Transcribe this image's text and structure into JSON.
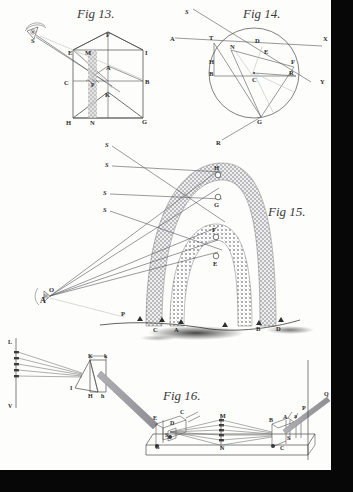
{
  "plate": {
    "description": "Engraved optics plate with four geometric figures",
    "paper_color": "#fdfdfb",
    "ink_color": "#3a3a3a",
    "border_color": "#070707"
  },
  "figures": [
    {
      "id": "fig13",
      "caption": "Fig 13.",
      "type": "house-section-geometry",
      "labels": [
        {
          "text": "S",
          "x": 34,
          "y": 40
        },
        {
          "text": "F",
          "x": 108,
          "y": 37
        },
        {
          "text": "E",
          "x": 70,
          "y": 55
        },
        {
          "text": "M",
          "x": 87,
          "y": 55
        },
        {
          "text": "I",
          "x": 146,
          "y": 55
        },
        {
          "text": "A",
          "x": 108,
          "y": 69
        },
        {
          "text": "C",
          "x": 66,
          "y": 86
        },
        {
          "text": "B",
          "x": 144,
          "y": 85
        },
        {
          "text": "P",
          "x": 95,
          "y": 86
        },
        {
          "text": "K",
          "x": 106,
          "y": 96
        },
        {
          "text": "H",
          "x": 68,
          "y": 122
        },
        {
          "text": "N",
          "x": 92,
          "y": 122
        },
        {
          "text": "G",
          "x": 144,
          "y": 120
        }
      ]
    },
    {
      "id": "fig14",
      "caption": "Fig 14.",
      "type": "circle-refraction-geometry",
      "labels": [
        {
          "text": "S",
          "x": 187,
          "y": 12
        },
        {
          "text": "A",
          "x": 172,
          "y": 41
        },
        {
          "text": "T",
          "x": 211,
          "y": 40
        },
        {
          "text": "D",
          "x": 257,
          "y": 42
        },
        {
          "text": "X",
          "x": 325,
          "y": 40
        },
        {
          "text": "N",
          "x": 232,
          "y": 48
        },
        {
          "text": "E",
          "x": 265,
          "y": 53
        },
        {
          "text": "H",
          "x": 212,
          "y": 63
        },
        {
          "text": "F",
          "x": 290,
          "y": 63
        },
        {
          "text": "B",
          "x": 212,
          "y": 74
        },
        {
          "text": "C",
          "x": 253,
          "y": 78
        },
        {
          "text": "R",
          "x": 288,
          "y": 73
        },
        {
          "text": "Y",
          "x": 320,
          "y": 82
        },
        {
          "text": "G",
          "x": 258,
          "y": 119
        },
        {
          "text": "R",
          "x": 218,
          "y": 143
        }
      ]
    },
    {
      "id": "fig15",
      "caption": "Fig 15.",
      "type": "rainbow-double-arc",
      "ray_labels": [
        "S",
        "S",
        "S",
        "S"
      ],
      "labels": [
        {
          "text": "S",
          "x": 107,
          "y": 148
        },
        {
          "text": "S",
          "x": 107,
          "y": 168
        },
        {
          "text": "S",
          "x": 104,
          "y": 196
        },
        {
          "text": "S",
          "x": 104,
          "y": 213
        },
        {
          "text": "H",
          "x": 213,
          "y": 170
        },
        {
          "text": "G",
          "x": 213,
          "y": 203
        },
        {
          "text": "F",
          "x": 210,
          "y": 232
        },
        {
          "text": "E",
          "x": 213,
          "y": 262
        },
        {
          "text": "O",
          "x": 44,
          "y": 292
        },
        {
          "text": "A",
          "x": 42,
          "y": 300
        },
        {
          "text": "P",
          "x": 121,
          "y": 314
        },
        {
          "text": "C",
          "x": 155,
          "y": 330
        },
        {
          "text": "A",
          "x": 175,
          "y": 330
        },
        {
          "text": "B",
          "x": 258,
          "y": 330
        },
        {
          "text": "D",
          "x": 277,
          "y": 330
        }
      ]
    },
    {
      "id": "fig16",
      "caption": "Fig 16.",
      "type": "prism-spectrum-apparatus",
      "labels": [
        {
          "text": "L",
          "x": 10,
          "y": 342
        },
        {
          "text": "V",
          "x": 10,
          "y": 405
        },
        {
          "text": "K",
          "x": 91,
          "y": 357
        },
        {
          "text": "k",
          "x": 106,
          "y": 357
        },
        {
          "text": "I",
          "x": 72,
          "y": 387
        },
        {
          "text": "H",
          "x": 90,
          "y": 395
        },
        {
          "text": "h",
          "x": 103,
          "y": 395
        },
        {
          "text": "E",
          "x": 155,
          "y": 418
        },
        {
          "text": "D",
          "x": 172,
          "y": 423
        },
        {
          "text": "C",
          "x": 180,
          "y": 412
        },
        {
          "text": "S",
          "x": 166,
          "y": 435
        },
        {
          "text": "G",
          "x": 157,
          "y": 446
        },
        {
          "text": "M",
          "x": 222,
          "y": 420
        },
        {
          "text": "N",
          "x": 222,
          "y": 447
        },
        {
          "text": "B",
          "x": 270,
          "y": 421
        },
        {
          "text": "A",
          "x": 284,
          "y": 419
        },
        {
          "text": "a",
          "x": 295,
          "y": 418
        },
        {
          "text": "S",
          "x": 288,
          "y": 438
        },
        {
          "text": "C",
          "x": 282,
          "y": 448
        },
        {
          "text": "P",
          "x": 308,
          "y": 409
        },
        {
          "text": "Q",
          "x": 326,
          "y": 398
        }
      ]
    }
  ]
}
